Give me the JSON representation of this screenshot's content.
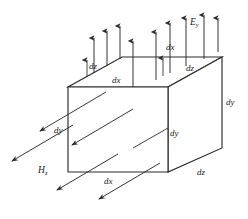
{
  "figure": {
    "kind": "3d-differential-volume-element-diagram",
    "stroke_color": "#2b2b2b",
    "fill_color": "#ffffff",
    "background": "#ffffff"
  },
  "labels": {
    "arrow_length_dz": "dz",
    "top_face_dx": "dx",
    "top_front_edge_dx": "dx",
    "top_right_edge_dz": "dz",
    "field_e_y": "E",
    "field_e_y_sub": "y",
    "left_edge_dy": "dy",
    "front_right_edge_dy": "dy",
    "far_right_edge_dy": "dy",
    "field_h_z": "H",
    "field_h_z_sub": "z",
    "bottom_front_edge_dx": "dx",
    "bottom_right_edge_dz": "dz"
  },
  "geometry": {
    "front_face": {
      "left": 68,
      "right": 168,
      "top": 87,
      "bottom": 172
    },
    "depth_offset": {
      "dx": 54,
      "dy": -30
    },
    "e_y_arrow_count": 8,
    "h_z_arrow_count": 5
  }
}
